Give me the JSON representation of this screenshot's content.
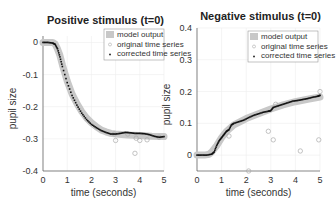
{
  "chart_data": [
    {
      "type": "scatter",
      "title": "Positive stimulus (t=0)",
      "xlabel": "time (seconds)",
      "ylabel": "pupil size",
      "xlim": [
        0,
        5
      ],
      "ylim": [
        -0.4,
        0.02
      ],
      "xticks": [
        "0",
        "1",
        "2",
        "3",
        "4",
        "5"
      ],
      "yticks": [
        "0",
        "-0.1",
        "-0.2",
        "-0.3",
        "-0.4"
      ],
      "ytick_values": [
        0,
        -0.1,
        -0.2,
        -0.3,
        -0.4
      ],
      "grid": true,
      "legend": {
        "position": "top-right",
        "entries": [
          "model output",
          "original time series",
          "corrected time series"
        ]
      },
      "series": [
        {
          "name": "model output",
          "x": [
            0,
            0.2,
            0.4,
            0.5,
            0.6,
            0.7,
            0.8,
            1.0,
            1.2,
            1.4,
            1.6,
            1.8,
            2.0,
            2.2,
            2.4,
            2.6,
            2.8,
            3.0,
            3.5,
            4.0,
            4.5,
            5.0
          ],
          "y": [
            0,
            0,
            0,
            -0.005,
            -0.02,
            -0.04,
            -0.07,
            -0.12,
            -0.16,
            -0.19,
            -0.215,
            -0.235,
            -0.25,
            -0.262,
            -0.272,
            -0.278,
            -0.283,
            -0.285,
            -0.288,
            -0.29,
            -0.292,
            -0.293
          ]
        },
        {
          "name": "original time series",
          "x": [
            2.95,
            3.0,
            3.5,
            3.8,
            3.85,
            4.0,
            4.3,
            4.8
          ],
          "y": [
            -0.285,
            -0.305,
            -0.285,
            -0.345,
            -0.298,
            -0.305,
            -0.303,
            -0.295
          ]
        },
        {
          "name": "corrected time series",
          "x": [
            0,
            0.2,
            0.4,
            0.5,
            0.6,
            0.7,
            0.8,
            1.0,
            1.2,
            1.4,
            1.6,
            1.8,
            2.0,
            2.2,
            2.4,
            2.6,
            2.8,
            3.0,
            3.2,
            3.4,
            3.6,
            3.8,
            4.0,
            4.2,
            4.4,
            4.6,
            4.8,
            5.0
          ],
          "y": [
            0,
            0,
            -0.002,
            -0.006,
            -0.02,
            -0.045,
            -0.075,
            -0.125,
            -0.165,
            -0.195,
            -0.22,
            -0.24,
            -0.255,
            -0.265,
            -0.274,
            -0.28,
            -0.285,
            -0.285,
            -0.283,
            -0.28,
            -0.281,
            -0.283,
            -0.283,
            -0.284,
            -0.287,
            -0.292,
            -0.295,
            -0.293
          ]
        }
      ]
    },
    {
      "type": "scatter",
      "title": "Negative stimulus (t=0)",
      "xlabel": "time (seconds)",
      "ylabel": "pupil size",
      "xlim": [
        0,
        5
      ],
      "ylim": [
        -0.05,
        0.4
      ],
      "xticks": [
        "0",
        "1",
        "2",
        "3",
        "4",
        "5"
      ],
      "yticks": [
        "0.4",
        "0.3",
        "0.2",
        "0.1",
        "0"
      ],
      "ytick_values": [
        0.4,
        0.3,
        0.2,
        0.1,
        0
      ],
      "grid": true,
      "legend": {
        "position": "top-right",
        "entries": [
          "model output",
          "original time series",
          "corrected time series"
        ]
      },
      "series": [
        {
          "name": "model output",
          "x": [
            0,
            0.3,
            0.5,
            0.6,
            0.8,
            1.0,
            1.2,
            1.5,
            2.0,
            2.5,
            3.0,
            3.5,
            4.0,
            4.5,
            5.0
          ],
          "y": [
            0,
            0,
            0.003,
            0.01,
            0.03,
            0.055,
            0.075,
            0.095,
            0.115,
            0.13,
            0.145,
            0.158,
            0.168,
            0.176,
            0.183
          ]
        },
        {
          "name": "original time series",
          "x": [
            1.3,
            2.1,
            2.9,
            3.1,
            4.2,
            4.95,
            5.0,
            3.2
          ],
          "y": [
            0.06,
            -0.05,
            0.075,
            0.048,
            0.013,
            0.048,
            0.2,
            0.16
          ]
        },
        {
          "name": "corrected time series",
          "x": [
            0,
            0.2,
            0.4,
            0.6,
            0.7,
            0.8,
            0.9,
            1.0,
            1.1,
            1.2,
            1.3,
            1.4,
            1.5,
            1.7,
            1.9,
            2.1,
            2.3,
            2.5,
            2.7,
            2.9,
            3.0,
            3.1,
            3.3,
            3.5,
            3.7,
            3.9,
            4.1,
            4.3,
            4.5,
            4.7,
            4.9,
            5.0
          ],
          "y": [
            0,
            0,
            0,
            0.003,
            0.01,
            0.03,
            0.045,
            0.055,
            0.065,
            0.075,
            0.08,
            0.095,
            0.1,
            0.105,
            0.11,
            0.118,
            0.125,
            0.13,
            0.135,
            0.138,
            0.14,
            0.15,
            0.155,
            0.16,
            0.165,
            0.17,
            0.172,
            0.175,
            0.178,
            0.182,
            0.185,
            0.188
          ]
        }
      ]
    }
  ]
}
